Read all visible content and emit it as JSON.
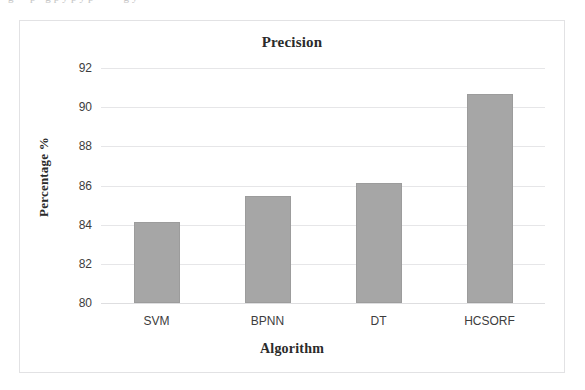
{
  "figure": {
    "bleed_caption": "g      ·  ·  p  ·      g  p  y  p  y  p  ·       ·   ·  ·      g  y ",
    "frame_color": "#e2e2e4",
    "background": "#ffffff"
  },
  "chart_data": {
    "type": "bar",
    "title": "Precision",
    "xlabel": "Algorithm",
    "ylabel": "Percentage %",
    "categories": [
      "SVM",
      "BPNN",
      "DT",
      "HCSORF"
    ],
    "values": [
      84.15,
      85.45,
      86.15,
      90.65
    ],
    "series": [
      {
        "name": "Precision",
        "values": [
          84.15,
          85.45,
          86.15,
          90.65
        ]
      }
    ],
    "ylim": [
      80,
      92
    ],
    "ytick_labels": [
      "80",
      "82",
      "84",
      "86",
      "88",
      "90",
      "92"
    ],
    "ytick_values": [
      80,
      82,
      84,
      86,
      88,
      90,
      92
    ],
    "grid": true,
    "grid_axis": "y",
    "legend": false,
    "bar_color": "#a6a6a6",
    "bar_edge_color": "#9c9c9c",
    "gridline_color": "#e6e6e8",
    "tick_label_color": "#3d3d3d"
  }
}
